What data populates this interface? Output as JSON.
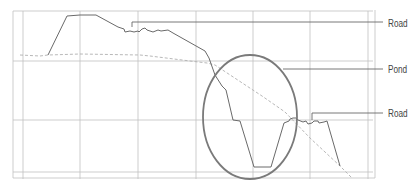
{
  "diagram": {
    "type": "elevation-profile",
    "colors": {
      "grid": "#b8b8b8",
      "profile": "#6a6a6a",
      "dashed": "#a8a8a8",
      "ellipse": "#777777",
      "leader": "#6a6a6a",
      "label": "#444444"
    },
    "labels": [
      {
        "text": "Road",
        "x": 388,
        "y": 24
      },
      {
        "text": "Pond",
        "x": 388,
        "y": 70
      },
      {
        "text": "Road",
        "x": 388,
        "y": 114
      }
    ],
    "grid": {
      "vertical_x": [
        23,
        80,
        138,
        196,
        253,
        310,
        368
      ],
      "horizontal_y": [
        61,
        120,
        172
      ],
      "frame": {
        "left": 13,
        "top": 11,
        "right": 373,
        "bottom": 178
      }
    },
    "profile_points": [
      [
        48,
        55
      ],
      [
        67,
        16
      ],
      [
        80,
        15
      ],
      [
        96,
        15
      ],
      [
        118,
        27
      ],
      [
        124,
        29
      ],
      [
        125,
        32
      ],
      [
        130,
        31
      ],
      [
        134,
        32
      ],
      [
        138,
        31
      ],
      [
        139,
        32
      ],
      [
        142,
        29
      ],
      [
        145,
        28
      ],
      [
        147,
        30
      ],
      [
        153,
        32
      ],
      [
        158,
        30
      ],
      [
        161,
        31
      ],
      [
        168,
        30
      ],
      [
        173,
        33
      ],
      [
        205,
        51
      ],
      [
        209,
        58
      ],
      [
        215,
        75
      ],
      [
        222,
        86
      ],
      [
        226,
        90
      ],
      [
        233,
        120
      ],
      [
        240,
        121
      ],
      [
        254,
        167
      ],
      [
        271,
        167
      ],
      [
        284,
        123
      ],
      [
        289,
        121
      ],
      [
        290,
        119
      ],
      [
        293,
        118
      ],
      [
        296,
        118
      ],
      [
        298,
        120
      ],
      [
        303,
        122
      ],
      [
        306,
        121
      ],
      [
        308,
        124
      ],
      [
        312,
        123
      ],
      [
        314,
        121
      ],
      [
        318,
        121
      ],
      [
        319,
        123
      ],
      [
        324,
        122
      ],
      [
        327,
        121
      ],
      [
        340,
        166
      ]
    ],
    "dashed_points": [
      [
        20,
        55
      ],
      [
        40,
        56
      ],
      [
        48,
        55
      ],
      [
        80,
        54
      ],
      [
        140,
        55
      ],
      [
        150,
        56
      ],
      [
        190,
        61
      ],
      [
        207,
        63
      ],
      [
        215,
        65
      ],
      [
        262,
        96
      ],
      [
        285,
        112
      ],
      [
        310,
        138
      ],
      [
        340,
        166
      ],
      [
        352,
        178
      ]
    ],
    "ellipse": {
      "cx": 250,
      "cy": 117,
      "rx": 47,
      "ry": 62
    },
    "leaders": [
      {
        "from": [
          132,
          27
        ],
        "corner": [
          132,
          22
        ],
        "to": [
          383,
          22
        ]
      },
      {
        "from": [
          283,
          69
        ],
        "corner": null,
        "to": [
          383,
          69
        ]
      },
      {
        "from": [
          312,
          120
        ],
        "corner": [
          312,
          113
        ],
        "to": [
          383,
          113
        ]
      }
    ]
  }
}
